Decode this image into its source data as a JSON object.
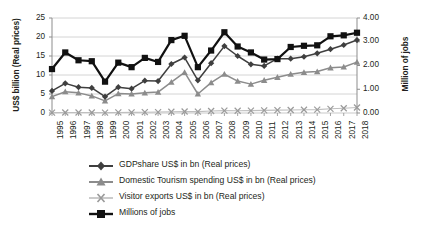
{
  "chart_data": {
    "type": "line",
    "title": "",
    "xlabel": "",
    "ylabel": "US$ billion (Real prices)",
    "y2label": "Million of jobs",
    "ylim": [
      0,
      25
    ],
    "y2lim": [
      0,
      4.0
    ],
    "yticks": [
      "0",
      "5",
      "10",
      "15",
      "20",
      "25"
    ],
    "y2ticks": [
      "0.00",
      "1.00",
      "2.00",
      "3.00",
      "4.00"
    ],
    "grid": true,
    "legend_position": "bottom",
    "categories": [
      "1995",
      "1996",
      "1997",
      "1998",
      "1999",
      "2000",
      "2001",
      "2002",
      "2003",
      "2004",
      "2005",
      "2006",
      "2007",
      "2008",
      "2009",
      "2010",
      "2011",
      "2012",
      "2013",
      "2014",
      "2015",
      "2016",
      "2017",
      "2018"
    ],
    "series": [
      {
        "name": "GDPshare US$ in bn (Real prices)",
        "axis": "left",
        "marker": "diamond",
        "color": "#3f3f3f",
        "values": [
          5.8,
          7.8,
          6.8,
          6.6,
          4.3,
          6.8,
          6.4,
          8.5,
          8.4,
          12.9,
          14.6,
          8.6,
          13.1,
          17.6,
          15.0,
          12.8,
          12.4,
          14.3,
          14.3,
          14.8,
          15.7,
          16.8,
          17.9,
          19.2
        ]
      },
      {
        "name": "Domestic Tourism spending US$ in bn (Real prices)",
        "axis": "left",
        "marker": "triangle",
        "color": "#8c8c8c",
        "values": [
          4.3,
          5.6,
          5.3,
          4.5,
          3.2,
          5.1,
          5.0,
          5.3,
          5.5,
          8.1,
          10.7,
          5.0,
          8.0,
          10.2,
          8.4,
          7.6,
          8.6,
          9.4,
          10.2,
          10.7,
          10.9,
          11.9,
          12.1,
          13.4
        ]
      },
      {
        "name": "Visitor exports US$ in bn (Real prices)",
        "axis": "left",
        "marker": "x",
        "color": "#bfbfbf",
        "values": [
          0.1,
          0.13,
          0.14,
          0.13,
          0.11,
          0.15,
          0.17,
          0.21,
          0.25,
          0.33,
          0.4,
          0.35,
          0.52,
          0.62,
          0.6,
          0.62,
          0.7,
          0.75,
          0.8,
          0.85,
          0.9,
          1.1,
          1.25,
          1.45
        ]
      },
      {
        "name": "Millions of jobs",
        "axis": "right",
        "marker": "square",
        "color": "#111111",
        "values": [
          1.85,
          2.55,
          2.22,
          2.18,
          1.32,
          2.12,
          1.93,
          2.32,
          2.15,
          3.07,
          3.25,
          1.93,
          2.63,
          3.4,
          2.8,
          2.55,
          2.25,
          2.27,
          2.78,
          2.83,
          2.85,
          3.23,
          3.27,
          3.38
        ]
      }
    ]
  },
  "legend": {
    "items": [
      {
        "label": "GDPshare US$ in bn (Real prices)",
        "marker": "diamond-marker",
        "color": "#3f3f3f"
      },
      {
        "label": "Domestic Tourism spending US$ in bn (Real prices)",
        "marker": "triangle-marker",
        "color": "#8c8c8c"
      },
      {
        "label": "Visitor exports US$ in bn (Real prices)",
        "marker": "x-marker",
        "color": "#bfbfbf"
      },
      {
        "label": "Millions of jobs",
        "marker": "square-marker",
        "color": "#111111"
      }
    ]
  }
}
